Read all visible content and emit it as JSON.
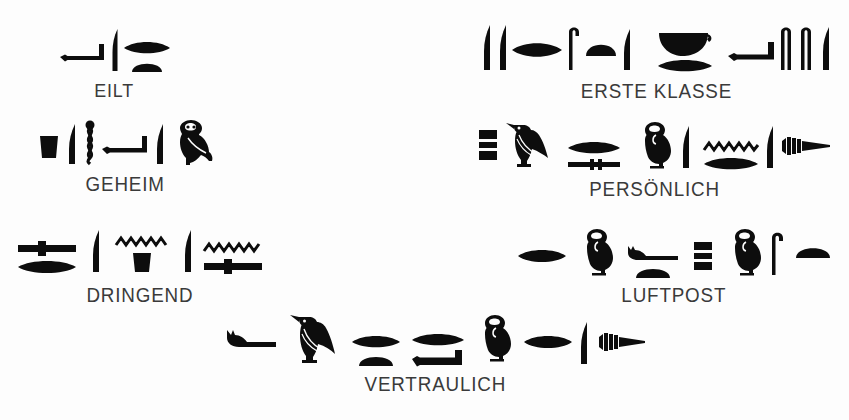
{
  "document": {
    "kind": "hieroglyph-label-sheet",
    "language": "German",
    "ink_color": "#0d0d0d",
    "background_color": "#fdfdfd",
    "text_color": "#3a3a3a"
  },
  "groups": [
    {
      "id": "eilt",
      "caption": "EILT",
      "meaning": "urgent / express",
      "glyph_names": [
        "arm-glyph",
        "reed-glyph",
        "mouth-glyph",
        "half-loaf-glyph"
      ],
      "glyph_count": 4
    },
    {
      "id": "erste-klasse",
      "caption": "ERSTE KLASSE",
      "meaning": "first class",
      "glyph_names": [
        "reed-glyph",
        "reed-glyph",
        "mouth-glyph",
        "crook-glyph",
        "half-loaf-glyph",
        "reed-glyph",
        "basket-glyph",
        "mouth-glyph",
        "arm-glyph",
        "crook-glyph",
        "crook-glyph",
        "reed-glyph"
      ],
      "glyph_count": 12
    },
    {
      "id": "geheim",
      "caption": "GEHEIM",
      "meaning": "secret",
      "glyph_names": [
        "jar-stand-glyph",
        "feather-glyph",
        "twisted-flax-glyph",
        "arm-glyph",
        "reed-glyph",
        "owl-glyph"
      ],
      "glyph_count": 6
    },
    {
      "id": "persoenlich",
      "caption": "PERSÖNLICH",
      "meaning": "personal",
      "glyph_names": [
        "stool-glyph",
        "vulture-glyph",
        "mouth-glyph",
        "bolt-glyph",
        "owl-glyph",
        "feather-glyph",
        "water-glyph",
        "mouth-glyph",
        "feather-glyph",
        "wick-glyph"
      ],
      "glyph_count": 10
    },
    {
      "id": "dringend",
      "caption": "DRINGEND",
      "meaning": "urgent",
      "glyph_names": [
        "bolt-glyph",
        "mouth-glyph",
        "feather-glyph",
        "water-glyph",
        "jar-stand-glyph",
        "feather-glyph",
        "water-glyph",
        "bolt-glyph"
      ],
      "glyph_count": 8
    },
    {
      "id": "luftpost",
      "caption": "LUFTPOST",
      "meaning": "air mail",
      "glyph_names": [
        "mouth-glyph",
        "owl-glyph",
        "horned-viper-glyph",
        "half-loaf-glyph",
        "stool-glyph",
        "owl-glyph",
        "crook-glyph",
        "half-loaf-glyph"
      ],
      "glyph_count": 8
    },
    {
      "id": "vertraulich",
      "caption": "VERTRAULICH",
      "meaning": "confidential",
      "glyph_names": [
        "horned-viper-glyph",
        "vulture-glyph",
        "mouth-glyph",
        "half-loaf-glyph",
        "mouth-glyph",
        "arm-glyph",
        "owl-glyph",
        "mouth-glyph",
        "feather-glyph",
        "wick-glyph"
      ],
      "glyph_count": 10
    }
  ]
}
